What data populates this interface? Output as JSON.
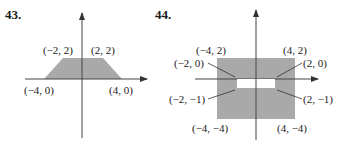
{
  "figures": [
    {
      "number": "43.",
      "shape": "trapezoid",
      "fill_color": "#a9a9a9",
      "vertices": [
        {
          "label": "(−2, 2)",
          "x": -2,
          "y": 2
        },
        {
          "label": "(2, 2)",
          "x": 2,
          "y": 2
        },
        {
          "label": "(−4, 0)",
          "x": -4,
          "y": 0
        },
        {
          "label": "(4, 0)",
          "x": 4,
          "y": 0
        }
      ]
    },
    {
      "number": "44.",
      "shape": "rectangle with rectangular hole",
      "fill_color": "#a9a9a9",
      "hole_color": "#ffffff",
      "outer_vertices": [
        {
          "label": "(−4, 2)",
          "x": -4,
          "y": 2
        },
        {
          "label": "(4, 2)",
          "x": 4,
          "y": 2
        },
        {
          "label": "(−4, −4)",
          "x": -4,
          "y": -4
        },
        {
          "label": "(4, −4)",
          "x": 4,
          "y": -4
        }
      ],
      "hole_vertices": [
        {
          "label": "(−2, 0)",
          "x": -2,
          "y": 0
        },
        {
          "label": "(2, 0)",
          "x": 2,
          "y": 0
        },
        {
          "label": "(−2, −1)",
          "x": -2,
          "y": -1
        },
        {
          "label": "(2, −1)",
          "x": 2,
          "y": -1
        }
      ]
    }
  ]
}
